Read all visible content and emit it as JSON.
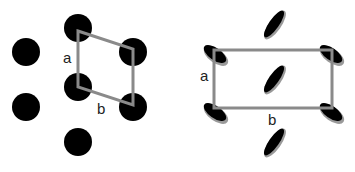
{
  "figure": {
    "left_panel": {
      "title": "Oblique lattice of circular molecules",
      "cell_label_a": "a",
      "cell_label_b": "b",
      "molecule_shape": "circle",
      "molecule_color": "#000000",
      "cell_color": "#8a8a8a"
    },
    "right_panel": {
      "title": "Rectangular lattice of tilted elliptical molecules",
      "cell_label_a": "a",
      "cell_label_b": "b",
      "molecule_shape": "tilted-ellipse",
      "molecule_color": "#000000",
      "shadow_color": "#9a9a9a",
      "cell_color": "#8a8a8a"
    }
  }
}
